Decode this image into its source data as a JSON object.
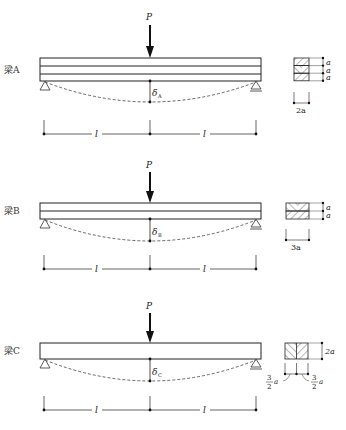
{
  "load_label": "P",
  "span_label": "l",
  "colors": {
    "line": "#222222",
    "dashed": "#444444",
    "background": "#ffffff"
  },
  "beams": [
    {
      "name": "梁A",
      "deflection_symbol": "δ",
      "deflection_sub": "A",
      "layers": 3,
      "section": {
        "layer_labels": [
          "a",
          "a",
          "a"
        ],
        "width_label": "2a"
      }
    },
    {
      "name": "梁B",
      "deflection_symbol": "δ",
      "deflection_sub": "B",
      "layers": 2,
      "section": {
        "layer_labels": [
          "a",
          "a"
        ],
        "width_label": "3a"
      }
    },
    {
      "name": "梁C",
      "deflection_symbol": "δ",
      "deflection_sub": "C",
      "layers": 1,
      "section": {
        "height_label": "2a",
        "left_frac_num": "3",
        "left_frac_den": "2",
        "left_frac_var": "a",
        "right_frac_num": "3",
        "right_frac_den": "2",
        "right_frac_var": "a"
      }
    }
  ]
}
